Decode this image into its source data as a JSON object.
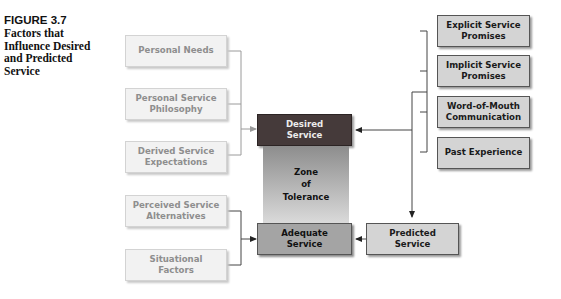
{
  "figure": {
    "number": "FIGURE 3.7",
    "title_lines": [
      "Factors that",
      "Influence Desired",
      "and Predicted",
      "Service"
    ]
  },
  "left_factors_desired": [
    {
      "lines": [
        "Personal Needs"
      ]
    },
    {
      "lines": [
        "Personal Service",
        "Philosophy"
      ]
    },
    {
      "lines": [
        "Derived Service",
        "Expectations"
      ]
    }
  ],
  "left_factors_adequate": [
    {
      "lines": [
        "Perceived Service",
        "Alternatives"
      ]
    },
    {
      "lines": [
        "Situational",
        "Factors"
      ]
    }
  ],
  "right_factors": [
    {
      "lines": [
        "Explicit Service",
        "Promises"
      ]
    },
    {
      "lines": [
        "Implicit Service",
        "Promises"
      ]
    },
    {
      "lines": [
        "Word-of-Mouth",
        "Communication"
      ]
    },
    {
      "lines": [
        "Past Experience"
      ]
    }
  ],
  "center": {
    "desired": [
      "Desired",
      "Service"
    ],
    "zone": [
      "Zone",
      "of",
      "Tolerance"
    ],
    "adequate": [
      "Adequate",
      "Service"
    ]
  },
  "predicted": [
    "Predicted",
    "Service"
  ],
  "colors": {
    "desired_box": "#453a3a",
    "adequate_box": "#a4a4a4",
    "factor_box_right": "#d4d4d4",
    "factor_box_left": "#f2f2f2",
    "zone_gradient_top": "#8d8d8d",
    "zone_gradient_bottom": "#dadada"
  }
}
